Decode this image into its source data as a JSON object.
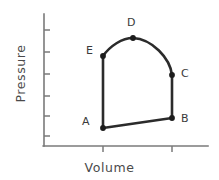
{
  "chart_data": {
    "type": "line",
    "title": "",
    "subtitle": "",
    "xlabel": "Volume",
    "ylabel": "Pressure",
    "xticklabels": [],
    "yticklabels": [],
    "grid": false,
    "legend": null,
    "axis_color": "#7a7a7a",
    "curve_color": "#2b2b2b",
    "marker_color": "#1c1c1c",
    "xlim": [
      0,
      10
    ],
    "ylim": [
      0,
      10
    ],
    "x_tick_count": 2,
    "y_tick_count": 6,
    "annotations": [
      "A",
      "B",
      "C",
      "D",
      "E"
    ],
    "points": [
      {
        "name": "A",
        "volume": 3.6,
        "pressure": 1.35,
        "px": 103,
        "py": 128
      },
      {
        "name": "B",
        "volume": 7.8,
        "pressure": 2.1,
        "px": 172,
        "py": 118
      },
      {
        "name": "C",
        "volume": 7.8,
        "pressure": 5.4,
        "px": 172,
        "py": 75
      },
      {
        "name": "D",
        "volume": 5.4,
        "pressure": 8.2,
        "px": 133,
        "py": 38
      },
      {
        "name": "E",
        "volume": 3.6,
        "pressure": 6.8,
        "px": 103,
        "py": 56
      }
    ],
    "segments": [
      {
        "from": "A",
        "to": "B",
        "shape": "straight"
      },
      {
        "from": "B",
        "to": "C",
        "shape": "straight"
      },
      {
        "from": "C",
        "to": "D",
        "shape": "curved"
      },
      {
        "from": "D",
        "to": "E",
        "shape": "curved"
      },
      {
        "from": "E",
        "to": "A",
        "shape": "straight"
      }
    ],
    "path_d": "M 103 128 L 172 118 L 172 75 C 170 58 152 39 133 38 C 122 38 110 46 103 56 L 103 128",
    "y_axis": {
      "x": 44,
      "top": 14,
      "bottom": 146
    },
    "x_axis": {
      "y": 146,
      "left": 44,
      "right": 208
    },
    "y_ticks_py": [
      30,
      52,
      74,
      96,
      116,
      136
    ],
    "x_ticks_px": [
      103,
      172
    ]
  },
  "labels": {
    "A": "A",
    "B": "B",
    "C": "C",
    "D": "D",
    "E": "E",
    "xlabel": "Volume",
    "ylabel": "Pressure"
  }
}
